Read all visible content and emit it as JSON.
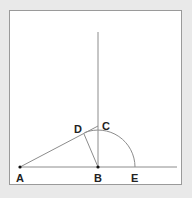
{
  "diagram": {
    "type": "geometry-construction",
    "colors": {
      "background": "#e9e9e9",
      "frame_fill": "#ffffff",
      "frame_border": "#9a9a9a",
      "line": "#8c8c8c",
      "point": "#111111",
      "label": "#222222"
    },
    "points": [
      {
        "id": "A",
        "label": "A",
        "x": 20,
        "y": 167
      },
      {
        "id": "B",
        "label": "B",
        "x": 98,
        "y": 167
      },
      {
        "id": "C",
        "label": "C",
        "x": 98,
        "y": 126
      },
      {
        "id": "D",
        "label": "D",
        "x": 84,
        "y": 134
      },
      {
        "id": "E",
        "label": "E",
        "x": 135,
        "y": 167
      }
    ],
    "labels": {
      "A": "A",
      "B": "B",
      "C": "C",
      "D": "D",
      "E": "E"
    },
    "segments": [
      {
        "name": "horizontal-baseline",
        "from": "A",
        "to_x": 177,
        "to_y": 167
      },
      {
        "name": "vertical-line-through-B",
        "x": 98,
        "y1": 32,
        "y2": 167
      },
      {
        "name": "segment-AC",
        "from": "A",
        "to": "C"
      },
      {
        "name": "segment-BD",
        "from": "B",
        "to": "D"
      }
    ],
    "arc": {
      "center": "B",
      "radius": 37,
      "from": "E",
      "to": "D"
    }
  }
}
